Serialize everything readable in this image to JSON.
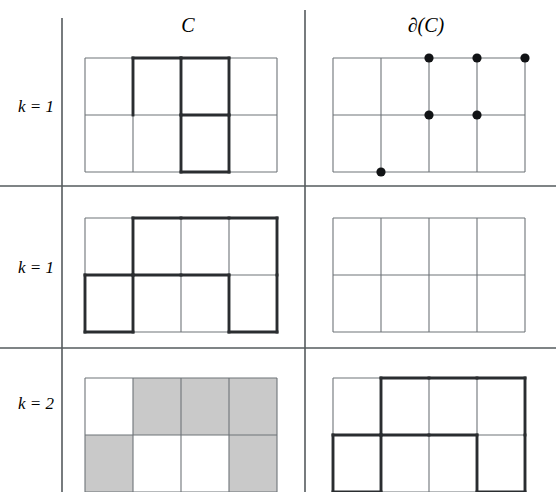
{
  "figure": {
    "width": 556,
    "height": 492,
    "background_color": "#ffffff",
    "thin_line_color": "#6e7478",
    "bold_line_color": "#2a2d30",
    "shaded_cell_color": "#c9c9c9",
    "dot_color": "#111315",
    "rule_color": "#555b5e"
  },
  "headers": {
    "left_column_label": "C",
    "right_column_label": "∂(C)"
  },
  "rows": [
    {
      "label": "k = 1"
    },
    {
      "label": "k = 1"
    },
    {
      "label": "k = 2"
    }
  ],
  "chart_data": {
    "type": "diagram",
    "title": "",
    "grid": {
      "cols": 4,
      "rows": 2
    },
    "panels": [
      {
        "row": 0,
        "row_label": "k = 1",
        "column": "C",
        "kind": "edges",
        "bold_horizontal_edges": [
          {
            "row": 0,
            "col": 1
          },
          {
            "row": 0,
            "col": 2
          },
          {
            "row": 1,
            "col": 2
          },
          {
            "row": 2,
            "col": 2
          }
        ],
        "bold_vertical_edges": [
          {
            "row": 0,
            "col": 1
          },
          {
            "row": 0,
            "col": 2
          },
          {
            "row": 0,
            "col": 3
          },
          {
            "row": 1,
            "col": 2
          },
          {
            "row": 1,
            "col": 3
          }
        ],
        "shaded_cells": [],
        "dots": []
      },
      {
        "row": 0,
        "row_label": "k = 1",
        "column": "∂(C)",
        "kind": "vertices",
        "bold_horizontal_edges": [],
        "bold_vertical_edges": [],
        "shaded_cells": [],
        "dots": [
          {
            "col": 2,
            "row": 0
          },
          {
            "col": 3,
            "row": 0
          },
          {
            "col": 4,
            "row": 0
          },
          {
            "col": 2,
            "row": 1
          },
          {
            "col": 3,
            "row": 1
          },
          {
            "col": 1,
            "row": 2
          }
        ]
      },
      {
        "row": 1,
        "row_label": "k = 1",
        "column": "C",
        "kind": "edges",
        "bold_horizontal_edges": [
          {
            "row": 0,
            "col": 1
          },
          {
            "row": 0,
            "col": 2
          },
          {
            "row": 0,
            "col": 3
          },
          {
            "row": 1,
            "col": 0
          },
          {
            "row": 1,
            "col": 1
          },
          {
            "row": 1,
            "col": 2
          },
          {
            "row": 2,
            "col": 0
          },
          {
            "row": 2,
            "col": 3
          }
        ],
        "bold_vertical_edges": [
          {
            "row": 0,
            "col": 1
          },
          {
            "row": 0,
            "col": 4
          },
          {
            "row": 1,
            "col": 0
          },
          {
            "row": 1,
            "col": 1
          },
          {
            "row": 1,
            "col": 3
          },
          {
            "row": 1,
            "col": 4
          }
        ],
        "shaded_cells": [],
        "dots": []
      },
      {
        "row": 1,
        "row_label": "k = 1",
        "column": "∂(C)",
        "kind": "empty",
        "bold_horizontal_edges": [],
        "bold_vertical_edges": [],
        "shaded_cells": [],
        "dots": []
      },
      {
        "row": 2,
        "row_label": "k = 2",
        "column": "C",
        "kind": "cells",
        "bold_horizontal_edges": [],
        "bold_vertical_edges": [],
        "shaded_cells": [
          {
            "row": 0,
            "col": 1
          },
          {
            "row": 0,
            "col": 2
          },
          {
            "row": 0,
            "col": 3
          },
          {
            "row": 1,
            "col": 0
          },
          {
            "row": 1,
            "col": 3
          }
        ],
        "dots": []
      },
      {
        "row": 2,
        "row_label": "k = 2",
        "column": "∂(C)",
        "kind": "edges",
        "bold_horizontal_edges": [
          {
            "row": 0,
            "col": 1
          },
          {
            "row": 0,
            "col": 2
          },
          {
            "row": 0,
            "col": 3
          },
          {
            "row": 1,
            "col": 0
          },
          {
            "row": 1,
            "col": 1
          },
          {
            "row": 1,
            "col": 2
          },
          {
            "row": 2,
            "col": 0
          },
          {
            "row": 2,
            "col": 3
          }
        ],
        "bold_vertical_edges": [
          {
            "row": 0,
            "col": 1
          },
          {
            "row": 0,
            "col": 4
          },
          {
            "row": 1,
            "col": 0
          },
          {
            "row": 1,
            "col": 1
          },
          {
            "row": 1,
            "col": 3
          },
          {
            "row": 1,
            "col": 4
          }
        ],
        "shaded_cells": [],
        "dots": []
      }
    ],
    "separators": {
      "vertical_lines": [
        {
          "name": "row-label-divider",
          "x": 62,
          "y1": 18,
          "y2": 492
        },
        {
          "name": "column-divider",
          "x": 305,
          "y1": 10,
          "y2": 492
        }
      ],
      "horizontal_lines": [
        {
          "name": "row1-row2-divider",
          "y": 186,
          "x1": 0,
          "x2": 556
        },
        {
          "name": "row2-row3-divider",
          "y": 348,
          "x1": 0,
          "x2": 556
        }
      ]
    }
  }
}
